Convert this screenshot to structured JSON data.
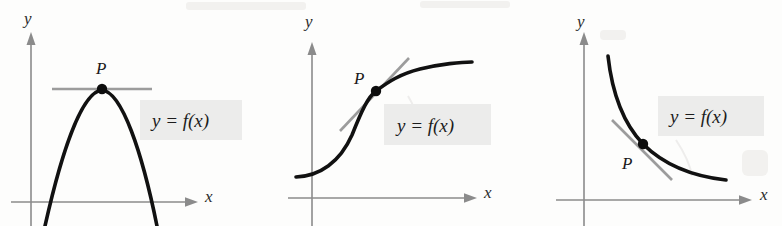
{
  "figure": {
    "background_color": "#fdfdfc",
    "curve_color": "#111111",
    "axis_color": "#8b8b8b",
    "tangent_color": "#9c9c9c",
    "label_box_color": "#ececeb"
  },
  "panels": [
    {
      "id": "panel-parabola",
      "curve_type": "downward-parabola",
      "x_axis_label": "x",
      "y_axis_label": "y",
      "point_label": "P",
      "function_label": "y = f(x)",
      "tangent_description": "horizontal tangent at vertex",
      "point_position": {
        "x": 102,
        "y": 89
      }
    },
    {
      "id": "panel-sigmoid",
      "curve_type": "increasing-sigmoid",
      "x_axis_label": "x",
      "y_axis_label": "y",
      "point_label": "P",
      "function_label": "y = f(x)",
      "tangent_description": "positive slope tangent at inflection point",
      "point_position": {
        "x": 376,
        "y": 91
      }
    },
    {
      "id": "panel-hyperbola",
      "curve_type": "decreasing-hyperbola",
      "x_axis_label": "x",
      "y_axis_label": "y",
      "point_label": "P",
      "function_label": "y = f(x)",
      "tangent_description": "negative slope tangent",
      "point_position": {
        "x": 643,
        "y": 144
      }
    }
  ]
}
